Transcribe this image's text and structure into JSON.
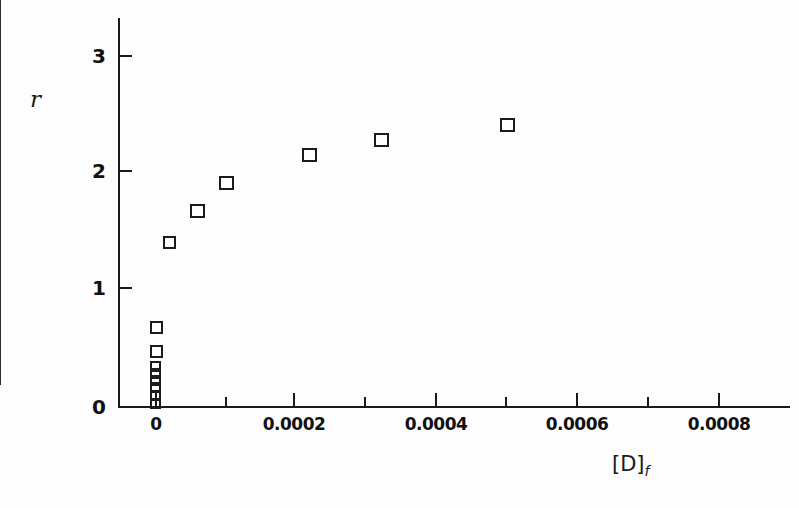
{
  "chart_data": {
    "type": "scatter",
    "title": "",
    "subtitle": "",
    "xlabel": "[D]",
    "xlabel_subscript": "f",
    "ylabel": "r",
    "xlim": [
      -5e-05,
      0.00091
    ],
    "ylim": [
      0,
      3.25
    ],
    "grid": false,
    "legend": "none",
    "marker_style": "open-square",
    "marker_color": "#1b1b1b",
    "x_ticks": [
      {
        "value": 0,
        "label": "0"
      },
      {
        "value": 0.0001,
        "label": ""
      },
      {
        "value": 0.0002,
        "label": "0.0002"
      },
      {
        "value": 0.0003,
        "label": ""
      },
      {
        "value": 0.0004,
        "label": "0.0004"
      },
      {
        "value": 0.0005,
        "label": ""
      },
      {
        "value": 0.0006,
        "label": "0.0006"
      },
      {
        "value": 0.0007,
        "label": ""
      },
      {
        "value": 0.0008,
        "label": "0.0008"
      }
    ],
    "y_ticks": [
      {
        "value": 0,
        "label": "0"
      },
      {
        "value": 1,
        "label": "1"
      },
      {
        "value": 2,
        "label": "2"
      },
      {
        "value": 3,
        "label": "3"
      }
    ],
    "points": [
      {
        "x": 2e-06,
        "y": 0.05
      },
      {
        "x": 3e-06,
        "y": 0.12
      },
      {
        "x": 4e-06,
        "y": 0.18
      },
      {
        "x": 5e-06,
        "y": 0.24
      },
      {
        "x": 6e-06,
        "y": 0.3
      },
      {
        "x": 8e-06,
        "y": 0.36
      },
      {
        "x": 1e-05,
        "y": 0.5
      },
      {
        "x": 1.2e-05,
        "y": 0.7
      },
      {
        "x": 2.2e-05,
        "y": 1.18
      },
      {
        "x": 6.1e-05,
        "y": 1.45
      },
      {
        "x": 9.9e-05,
        "y": 1.7
      },
      {
        "x": 0.000219,
        "y": 2.15
      },
      {
        "x": 0.000322,
        "y": 2.25
      },
      {
        "x": 0.000502,
        "y": 2.4
      }
    ]
  },
  "pixel_layout": {
    "note": "rendered marker positions in screenshot coordinates",
    "markers": [
      {
        "left": 150,
        "top": 398,
        "size": "sm"
      },
      {
        "left": 150,
        "top": 390,
        "size": "sm"
      },
      {
        "left": 150,
        "top": 382,
        "size": "sm"
      },
      {
        "left": 150,
        "top": 375,
        "size": "sm"
      },
      {
        "left": 150,
        "top": 368,
        "size": "sm"
      },
      {
        "left": 150,
        "top": 361,
        "size": "sm"
      },
      {
        "left": 150,
        "top": 345,
        "size": "md"
      },
      {
        "left": 150,
        "top": 321,
        "size": "md"
      },
      {
        "left": 163,
        "top": 236,
        "size": "md"
      },
      {
        "left": 190,
        "top": 204,
        "size": "lg"
      },
      {
        "left": 219,
        "top": 176,
        "size": "lg"
      },
      {
        "left": 302,
        "top": 148,
        "size": "lg"
      },
      {
        "left": 374,
        "top": 133,
        "size": "lg"
      },
      {
        "left": 500,
        "top": 118,
        "size": "lg"
      }
    ],
    "x_ticks_px": [
      155,
      225,
      293,
      364,
      435,
      505,
      576,
      647,
      718
    ],
    "y_ticks_px": [
      {
        "label": "0",
        "top": 406
      },
      {
        "label": "1",
        "top": 287
      },
      {
        "label": "2",
        "top": 170
      },
      {
        "label": "3",
        "top": 55
      }
    ]
  }
}
